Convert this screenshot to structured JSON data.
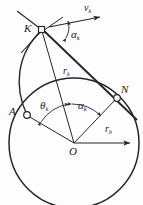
{
  "figure": {
    "type": "geometry-diagram",
    "stroke_color": "#262626",
    "background_color": "#fdfdfd"
  },
  "points": [
    {
      "id": "K",
      "label": "K",
      "x": 42,
      "y": 30,
      "marker": "small-square",
      "label_x": 25,
      "label_y": 24
    },
    {
      "id": "A",
      "label": "A",
      "x": 26,
      "y": 114,
      "marker": "small-circle",
      "label_x": 8,
      "label_y": 108
    },
    {
      "id": "N",
      "label": "N",
      "x": 117,
      "y": 98,
      "marker": "small-circle",
      "label_x": 122,
      "label_y": 87
    },
    {
      "id": "O",
      "label": "O",
      "x": 74,
      "y": 143,
      "marker": "none",
      "label_x": 68,
      "label_y": 147
    }
  ],
  "labels": {
    "velocity": {
      "text": "v",
      "sub": "k",
      "x": 85,
      "y": 5
    },
    "alpha_k_at_K": {
      "text": "α",
      "sub": "k",
      "x": 72,
      "y": 32
    },
    "r_k": {
      "text": "r",
      "sub": "k",
      "x": 64,
      "y": 70
    },
    "theta_k": {
      "text": "θ",
      "sub": "k",
      "x": 41,
      "y": 105
    },
    "alpha_k_at_O": {
      "text": "α",
      "sub": "k",
      "x": 79,
      "y": 104
    },
    "r_b": {
      "text": "r",
      "sub": "b",
      "x": 106,
      "y": 127
    }
  },
  "circle": {
    "name": "base-circle",
    "cx": 74,
    "cy": 143,
    "r": 65
  },
  "lines": [
    {
      "name": "tangent-line-K-N",
      "x1": 40,
      "y1": 28,
      "x2": 135,
      "y2": 118
    },
    {
      "name": "radius-O-K",
      "x1": 74,
      "y1": 143,
      "x2": 42,
      "y2": 31
    },
    {
      "name": "radius-O-N",
      "x1": 74,
      "y1": 143,
      "x2": 117,
      "y2": 98
    },
    {
      "name": "radius-O-A",
      "x1": 74,
      "y1": 143,
      "x2": 27,
      "y2": 115
    },
    {
      "name": "radius-O-rb",
      "x1": 74,
      "y1": 143,
      "x2": 132,
      "y2": 143
    },
    {
      "name": "velocity-vector",
      "x1": 50,
      "y1": 27,
      "x2": 103,
      "y2": 17
    },
    {
      "name": "ray-through-K-upper-left",
      "x1": 18,
      "y1": 12,
      "x2": 42,
      "y2": 30
    },
    {
      "name": "ray-through-K-lower-left",
      "x1": 42,
      "y1": 30,
      "x2": 22,
      "y2": 52
    },
    {
      "name": "ray-through-K-upper-right",
      "x1": 42,
      "y1": 30,
      "x2": 62,
      "y2": 18
    }
  ],
  "curve": {
    "name": "involute-curve",
    "path": "M 27,115 C 15,86 17,55 42,30"
  },
  "arcs": [
    {
      "name": "angle-arc-alpha-k-at-K",
      "d": "M 63,21 A 24,24 0 0 1 61,43"
    },
    {
      "name": "angle-arc-theta-k",
      "d": "M 39,120 A 40,40 0 0 1 72,103"
    },
    {
      "name": "angle-arc-alpha-k-at-O",
      "d": "M 74,103 A 40,40 0 0 1 102,115"
    }
  ]
}
